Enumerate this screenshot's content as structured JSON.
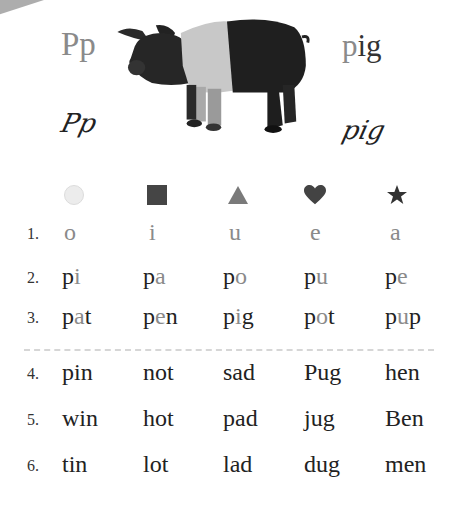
{
  "header": {
    "letters": "Pp",
    "word_prefix": "p",
    "word_rest": "ig",
    "cursive_letters": "Pp",
    "cursive_word": "pig",
    "image": "pig-photo"
  },
  "symbols": [
    {
      "name": "circle-icon",
      "color": "#e8e8e8"
    },
    {
      "name": "square-icon",
      "color": "#444444"
    },
    {
      "name": "triangle-icon",
      "color": "#777777"
    },
    {
      "name": "heart-icon",
      "color": "#444444"
    },
    {
      "name": "star-icon",
      "color": "#333333"
    }
  ],
  "colors": {
    "grey_highlight": "#8a8a8a",
    "text": "#222222",
    "divider": "#d6d6d6"
  },
  "rows": [
    {
      "number": "1.",
      "cells": [
        {
          "pre": "",
          "hl": "o",
          "post": ""
        },
        {
          "pre": "",
          "hl": "i",
          "post": ""
        },
        {
          "pre": "",
          "hl": "u",
          "post": ""
        },
        {
          "pre": "",
          "hl": "e",
          "post": ""
        },
        {
          "pre": "",
          "hl": "a",
          "post": ""
        }
      ]
    },
    {
      "number": "2.",
      "cells": [
        {
          "pre": "p",
          "hl": "i",
          "post": ""
        },
        {
          "pre": "p",
          "hl": "a",
          "post": ""
        },
        {
          "pre": "p",
          "hl": "o",
          "post": ""
        },
        {
          "pre": "p",
          "hl": "u",
          "post": ""
        },
        {
          "pre": "p",
          "hl": "e",
          "post": ""
        }
      ]
    },
    {
      "number": "3.",
      "cells": [
        {
          "pre": "p",
          "hl": "a",
          "post": "t"
        },
        {
          "pre": "p",
          "hl": "e",
          "post": "n"
        },
        {
          "pre": "p",
          "hl": "i",
          "post": "g"
        },
        {
          "pre": "p",
          "hl": "o",
          "post": "t"
        },
        {
          "pre": "p",
          "hl": "u",
          "post": "p"
        }
      ]
    },
    {
      "number": "4.",
      "cells": [
        {
          "pre": "pin",
          "hl": "",
          "post": ""
        },
        {
          "pre": "not",
          "hl": "",
          "post": ""
        },
        {
          "pre": "sad",
          "hl": "",
          "post": ""
        },
        {
          "pre": "Pug",
          "hl": "",
          "post": ""
        },
        {
          "pre": "hen",
          "hl": "",
          "post": ""
        }
      ]
    },
    {
      "number": "5.",
      "cells": [
        {
          "pre": "win",
          "hl": "",
          "post": ""
        },
        {
          "pre": "hot",
          "hl": "",
          "post": ""
        },
        {
          "pre": "pad",
          "hl": "",
          "post": ""
        },
        {
          "pre": "jug",
          "hl": "",
          "post": ""
        },
        {
          "pre": "Ben",
          "hl": "",
          "post": ""
        }
      ]
    },
    {
      "number": "6.",
      "cells": [
        {
          "pre": "tin",
          "hl": "",
          "post": ""
        },
        {
          "pre": "lot",
          "hl": "",
          "post": ""
        },
        {
          "pre": "lad",
          "hl": "",
          "post": ""
        },
        {
          "pre": "dug",
          "hl": "",
          "post": ""
        },
        {
          "pre": "men",
          "hl": "",
          "post": ""
        }
      ]
    }
  ]
}
